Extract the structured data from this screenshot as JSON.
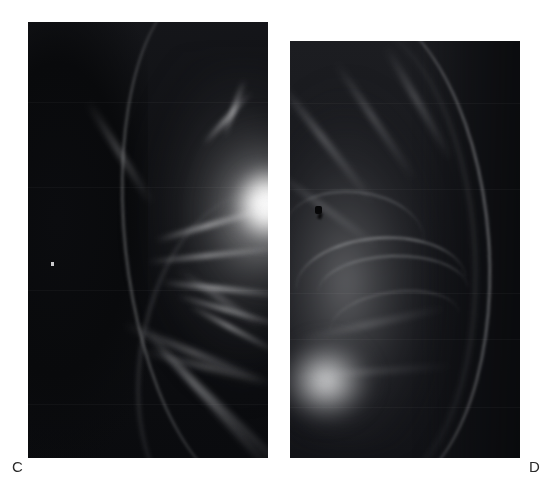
{
  "figure": {
    "kind": "medical-radiograph-figure",
    "modality": "mammogram",
    "panel_count": 2,
    "background_color": "#ffffff",
    "width": 554,
    "height": 499
  },
  "panels": [
    {
      "id": "panel-c",
      "label": "C",
      "label_position": "bottom-left",
      "view": "mediolateral-oblique",
      "x": 28,
      "y": 22,
      "width": 240,
      "height": 436,
      "description": "Dark mammographic field with a large irregular high-density mass in the upper-central region showing spiculated margins; skin line arcs along the anterior margin.",
      "features": [
        {
          "name": "dense-mass",
          "brightness": "very-high",
          "cx": 237,
          "cy": 186
        },
        {
          "name": "spiculated-strands",
          "brightness": "medium-high"
        },
        {
          "name": "skin-line",
          "brightness": "medium"
        },
        {
          "name": "fat-background",
          "brightness": "very-low"
        },
        {
          "name": "bright-dot-artifact",
          "cx": 52,
          "cy": 263
        }
      ],
      "colors": {
        "darkest": "#090a0c",
        "midtone": "#5f6063",
        "brightest": "#ffffff"
      }
    },
    {
      "id": "panel-d",
      "label": "D",
      "label_position": "bottom-right",
      "view": "mediolateral-oblique",
      "x": 290,
      "y": 41,
      "width": 230,
      "height": 417,
      "description": "Contralateral mammogram with predominantly fatty replaced tissue, curvilinear vascular and Cooper ligament markings, a bright sub-areolar density at the lower left, and a small dark marker artifact in the mid-upper field.",
      "features": [
        {
          "name": "fatty-parenchyma",
          "brightness": "medium-low"
        },
        {
          "name": "curvilinear-bands",
          "brightness": "medium"
        },
        {
          "name": "subareolar-density",
          "brightness": "high",
          "cx": 326,
          "cy": 383
        },
        {
          "name": "skin-line",
          "brightness": "medium-high"
        },
        {
          "name": "dark-marker-artifact",
          "cx": 318,
          "cy": 210
        }
      ],
      "colors": {
        "darkest": "#0a0b0e",
        "midtone": "#6a6b6e",
        "brightest": "#ecedee"
      }
    }
  ],
  "labels": {
    "c": "C",
    "d": "D"
  }
}
